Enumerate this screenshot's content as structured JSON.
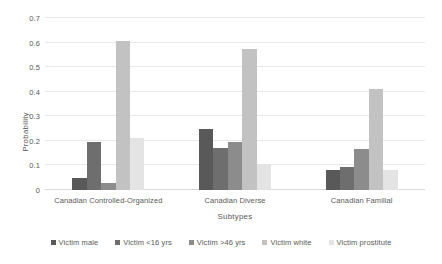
{
  "chart_data": {
    "type": "bar",
    "title": "",
    "xlabel": "Subtypes",
    "ylabel": "Probability",
    "categories": [
      "Canadian Controlled-Organized",
      "Canadian Diverse",
      "Canadian Familial"
    ],
    "series": [
      {
        "name": "Victim male",
        "color": "#595959",
        "values": [
          0.05,
          0.25,
          0.08
        ]
      },
      {
        "name": "Victim <16 yrs",
        "color": "#6e6e6e",
        "values": [
          0.195,
          0.17,
          0.095
        ]
      },
      {
        "name": "Victim >46 yrs",
        "color": "#8c8c8c",
        "values": [
          0.03,
          0.195,
          0.165
        ]
      },
      {
        "name": "Victim white",
        "color": "#c2c2c2",
        "values": [
          0.605,
          0.575,
          0.41
        ]
      },
      {
        "name": "Victim prostitute",
        "color": "#e4e4e4",
        "values": [
          0.21,
          0.105,
          0.08
        ]
      }
    ],
    "ylim": [
      0,
      0.7
    ],
    "yticks": [
      "0",
      "0.1",
      "0.2",
      "0.3",
      "0.4",
      "0.5",
      "0.6",
      "0.7"
    ],
    "ytick_values": [
      0,
      0.1,
      0.2,
      0.3,
      0.4,
      0.5,
      0.6,
      0.7
    ],
    "grid": true,
    "legend_position": "bottom",
    "background_color": "#ffffff",
    "gridline_color": "#e8e8e8",
    "text_color": "#595959"
  }
}
